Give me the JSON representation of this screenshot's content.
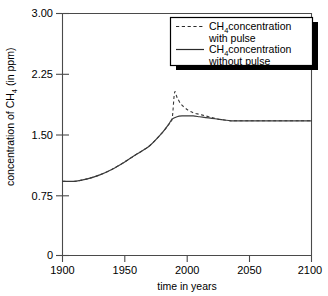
{
  "chart_data": {
    "type": "line",
    "title": "",
    "xlabel": "time in years",
    "ylabel": "concentration of CH4 (in ppm)",
    "ylabel_parts": {
      "prefix": "concentration of CH",
      "subscript": "4",
      "suffix": " (in ppm)"
    },
    "xlim": [
      1900,
      2100
    ],
    "ylim": [
      0,
      3.0
    ],
    "grid": false,
    "legend_position": "top-right",
    "xticks": [
      1900,
      1950,
      2000,
      2050,
      2100
    ],
    "xtick_labels": [
      "1900",
      "1950",
      "2000",
      "2050",
      "2100"
    ],
    "yticks": [
      0,
      0.75,
      1.5,
      2.25,
      3.0
    ],
    "ytick_labels": [
      "0",
      "0.75",
      "1.50",
      "2.25",
      "3.00"
    ],
    "series": [
      {
        "name": "CH4 concentration with pulse",
        "style": "dashed",
        "color": "#3a3a3a",
        "x": [
          1900,
          1910,
          1920,
          1930,
          1940,
          1950,
          1960,
          1970,
          1980,
          1985,
          1988,
          1990,
          1992,
          1995,
          2000,
          2005,
          2010,
          2015,
          2020,
          2025,
          2030,
          2035,
          2040,
          2050,
          2060,
          2070,
          2080,
          2090,
          2100
        ],
        "y": [
          0.92,
          0.92,
          0.95,
          1.0,
          1.07,
          1.16,
          1.26,
          1.36,
          1.52,
          1.62,
          1.69,
          2.02,
          1.96,
          1.88,
          1.81,
          1.77,
          1.75,
          1.73,
          1.71,
          1.69,
          1.68,
          1.67,
          1.67,
          1.67,
          1.67,
          1.67,
          1.67,
          1.67,
          1.67
        ]
      },
      {
        "name": "CH4 concentration without pulse",
        "style": "solid",
        "color": "#3a3a3a",
        "x": [
          1900,
          1910,
          1920,
          1930,
          1940,
          1950,
          1960,
          1970,
          1980,
          1985,
          1988,
          1992,
          1996,
          2000,
          2005,
          2010,
          2015,
          2020,
          2025,
          2030,
          2035,
          2040,
          2050,
          2060,
          2070,
          2080,
          2090,
          2100
        ],
        "y": [
          0.92,
          0.92,
          0.95,
          1.0,
          1.07,
          1.16,
          1.26,
          1.36,
          1.52,
          1.62,
          1.69,
          1.72,
          1.73,
          1.73,
          1.73,
          1.72,
          1.71,
          1.7,
          1.69,
          1.68,
          1.67,
          1.67,
          1.67,
          1.67,
          1.67,
          1.67,
          1.67,
          1.67
        ]
      }
    ]
  },
  "legend": {
    "entries": [
      {
        "style": "dashed",
        "line1_prefix": "CH",
        "line1_sub": "4",
        "line1_suffix": "concentration",
        "line2": "with pulse"
      },
      {
        "style": "solid",
        "line1_prefix": "CH",
        "line1_sub": "4",
        "line1_suffix": "concentration",
        "line2": "without pulse"
      }
    ]
  }
}
